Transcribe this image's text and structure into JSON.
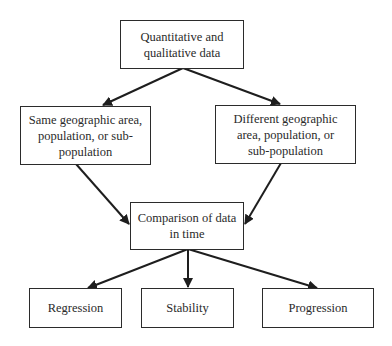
{
  "diagram": {
    "type": "flowchart",
    "nodes": [
      {
        "id": "data",
        "lines": [
          "Quantitative and",
          "qualitative data"
        ]
      },
      {
        "id": "same",
        "lines": [
          "Same geographic area,",
          "population, or sub-",
          "population"
        ]
      },
      {
        "id": "different",
        "lines": [
          "Different geographic",
          "area, population, or",
          "sub-population"
        ]
      },
      {
        "id": "comparison",
        "lines": [
          "Comparison of data",
          "in time"
        ]
      },
      {
        "id": "regression",
        "lines": [
          "Regression"
        ]
      },
      {
        "id": "stability",
        "lines": [
          "Stability"
        ]
      },
      {
        "id": "progression",
        "lines": [
          "Progression"
        ]
      }
    ],
    "edges": [
      {
        "from": "data",
        "to": "same"
      },
      {
        "from": "data",
        "to": "different"
      },
      {
        "from": "same",
        "to": "comparison"
      },
      {
        "from": "different",
        "to": "comparison"
      },
      {
        "from": "comparison",
        "to": "regression"
      },
      {
        "from": "comparison",
        "to": "stability"
      },
      {
        "from": "comparison",
        "to": "progression"
      }
    ],
    "colors": {
      "stroke": "#2b2b2b",
      "text": "#2a2a2a",
      "background": "#ffffff"
    }
  }
}
